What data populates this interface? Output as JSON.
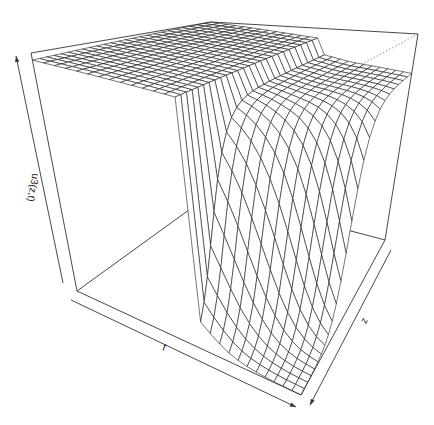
{
  "chart_data": {
    "type": "surface3d",
    "title": "",
    "xlabel": "t",
    "ylabel": "z",
    "zlabel": "u3(z,t)",
    "grid_resolution": [
      25,
      25
    ],
    "surface_model": {
      "plateau_value": 1.0,
      "corner_low_t_high_z": 1.0,
      "drop_along_z_near": 0.0,
      "notes": "u is near maximum across t, slopes slightly downward in t, and falls sharply to 0 as z approaches its minimum end at large t"
    },
    "box": {
      "bottom": {
        "left": [
          77,
          291
        ],
        "back": [
          211,
          194
        ],
        "right": [
          385,
          240
        ],
        "front": [
          301,
          395
        ]
      },
      "top": {
        "left": [
          31,
          53
        ],
        "back": [
          211,
          22
        ],
        "right": [
          418,
          34
        ],
        "front": [
          305,
          95
        ]
      }
    },
    "axes": {
      "t_arrow": {
        "from": [
          71,
          300
        ],
        "to": [
          296,
          407
        ]
      },
      "z_arrow": {
        "from": [
          391,
          250
        ],
        "to": [
          310,
          405
        ]
      },
      "u_arrow": {
        "from": [
          63,
          283
        ],
        "to": [
          16,
          56
        ]
      }
    },
    "label_positions": {
      "t": [
        163,
        350
      ],
      "z": [
        367,
        322
      ],
      "u": [
        30,
        187
      ]
    },
    "colors": {
      "line": "#1a1a1a",
      "box": "#333333",
      "background": "#ffffff"
    }
  }
}
